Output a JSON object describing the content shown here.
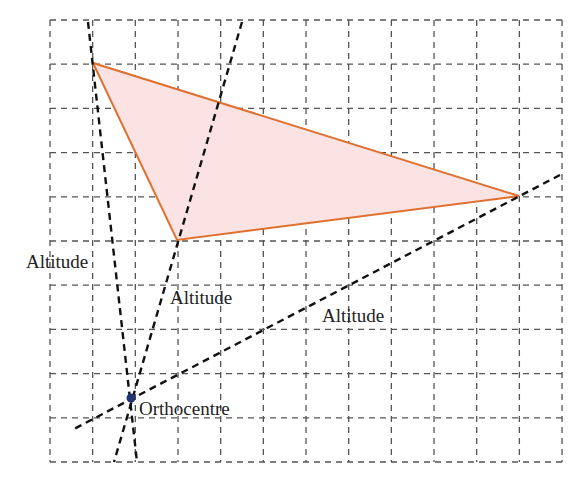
{
  "diagram": {
    "grid": {
      "x0": 50,
      "y0": 20,
      "cols": 12,
      "rows": 10,
      "cell_w": 42.67,
      "cell_h": 44.2,
      "color": "#555555"
    },
    "triangle": {
      "vertices": [
        [
          93,
          63
        ],
        [
          177,
          240
        ],
        [
          519,
          196
        ]
      ],
      "stroke": "#e07030",
      "fill": "#fbe3e3"
    },
    "altitudes": [
      {
        "from": [
          88,
          22
        ],
        "to": [
          137,
          462
        ]
      },
      {
        "from": [
          242,
          22
        ],
        "to": [
          114,
          462
        ]
      },
      {
        "from": [
          560,
          175
        ],
        "to": [
          72,
          430
        ]
      }
    ],
    "orthocentre": {
      "x": 131,
      "y": 398,
      "color": "#223377"
    },
    "labels": {
      "altitude_left": "Altitude",
      "altitude_middle": "Altitude",
      "altitude_right": "Altitude",
      "orthocentre": "Orthocentre"
    }
  }
}
